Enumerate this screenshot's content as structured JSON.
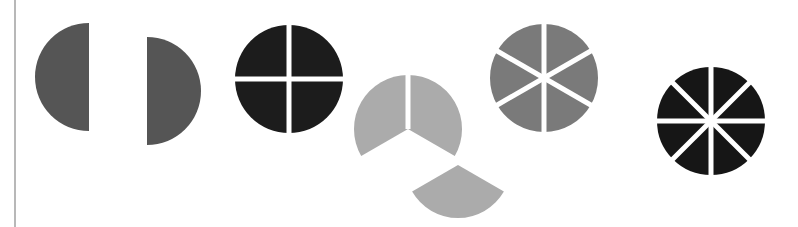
{
  "figure": {
    "colors": {
      "halves": "#555555",
      "quarters": "#1c1c1c",
      "thirds": "#ababab",
      "sixths": "#7a7a7a",
      "eighths": "#161616",
      "gap": "#ffffff",
      "rule": "#b8b8b8"
    },
    "shapes": [
      {
        "name": "halves",
        "parts": 2,
        "detached_piece": true
      },
      {
        "name": "quarters",
        "parts": 4,
        "detached_piece": false
      },
      {
        "name": "thirds",
        "parts": 3,
        "detached_piece": true
      },
      {
        "name": "sixths",
        "parts": 6,
        "detached_piece": false
      },
      {
        "name": "eighths",
        "parts": 8,
        "detached_piece": false
      }
    ]
  }
}
